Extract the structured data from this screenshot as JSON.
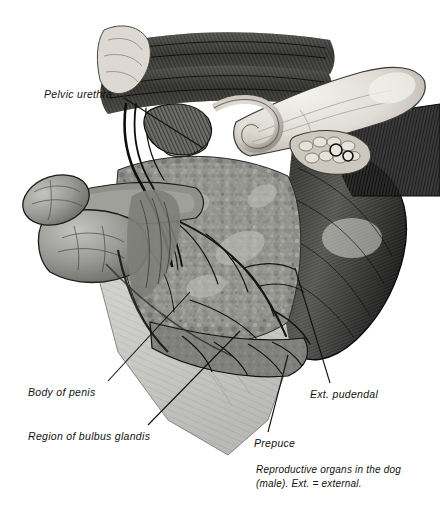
{
  "figure": {
    "title": "Reproductive organs in the dog (male)",
    "caption": "Reproductive organs in the dog (male). Ext. = external.",
    "caption_line1": "Reproductive organs in the dog",
    "caption_line2": "(male). Ext. = external.",
    "medium": "grayscale pen-and-ink anatomical illustration",
    "background_color": "#ffffff",
    "ink_color": "#111111"
  },
  "labels": {
    "pelvic_urethra": "Pelvic urethra",
    "body_of_penis": "Body of penis",
    "region_of_bulbus_glandis": "Region of bulbus glandis",
    "ext_pudendal": "Ext. pudendal",
    "prepuce": "Prepuce"
  },
  "leader_lines": [
    {
      "name": "leader-pelvic-urethra",
      "from": [
        124,
        98
      ],
      "to": [
        203,
        148
      ]
    },
    {
      "name": "leader-body-of-penis",
      "from": [
        108,
        381
      ],
      "to": [
        190,
        292
      ]
    },
    {
      "name": "leader-bulbus-glandis",
      "from": [
        148,
        425
      ],
      "to": [
        240,
        331
      ]
    },
    {
      "name": "leader-ext-pudendal",
      "from": [
        330,
        383
      ],
      "to": [
        295,
        268
      ]
    },
    {
      "name": "leader-prepuce",
      "from": [
        268,
        432
      ],
      "to": [
        288,
        355
      ]
    }
  ],
  "structures": [
    {
      "name": "sacrocaudal-muscle-band",
      "tone": "#3a3a3a",
      "description": "dark striated muscle band across upper area"
    },
    {
      "name": "pelvic-bone",
      "tone": "#e8e6e0",
      "description": "pale bone running diagonally upper right"
    },
    {
      "name": "coiled-duct",
      "tone": "#dedbd4",
      "description": "pale coiled ductus deferens / bladder neck"
    },
    {
      "name": "prostate-nodules",
      "tone": "#cfcac0",
      "description": "nodular pale cluster beneath bone"
    },
    {
      "name": "penis-tip",
      "tone": "#9a9a96",
      "description": "bulbous free end of penis at left"
    },
    {
      "name": "bulbus-glandis",
      "tone": "#8e8e8a",
      "description": "swelling proximal to penis tip"
    },
    {
      "name": "central-muscle-mass",
      "tone": "#8a8a86",
      "description": "mottled muscle mass with branching vessels"
    },
    {
      "name": "gluteal-muscle",
      "tone": "#2e2e2e",
      "description": "dark fanned striated muscle on right"
    },
    {
      "name": "skin-flap",
      "tone": "#cdcdc9",
      "description": "light reflected skin flap at lower center"
    },
    {
      "name": "vessel-network",
      "tone": "#151515",
      "description": "dark branching blood vessels"
    }
  ]
}
